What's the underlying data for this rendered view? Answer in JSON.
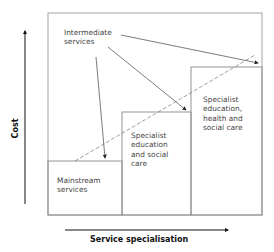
{
  "diagram": {
    "axes": {
      "y_label": "Cost",
      "x_label": "Service specialisation"
    },
    "labels": {
      "intermediate": "Intermediate\nservices",
      "mainstream": "Mainstream\nservices",
      "specialist_edu_social": "Specialist\neducation\nand social\ncare",
      "specialist_edu_health_social": "Specialist\neducation,\nhealth and\nsocial care"
    },
    "colors": {
      "box_stroke": "#888888",
      "arrow": "#333333",
      "axis": "#111111"
    }
  }
}
